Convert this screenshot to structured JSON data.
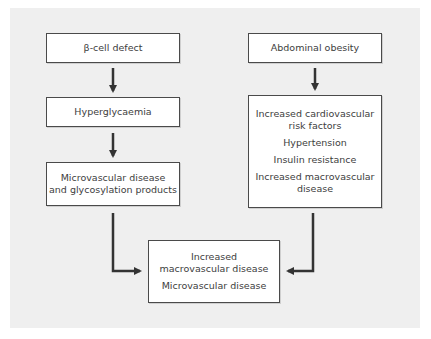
{
  "diagram": {
    "type": "flowchart",
    "colors": {
      "panel": "#efefef",
      "box_fill": "#ffffff",
      "box_border": "#4a4a4a",
      "arrow": "#333333",
      "text": "#3d3d3d"
    },
    "nodes": {
      "beta_cell": {
        "lines": [
          "β-cell defect"
        ]
      },
      "hyperglycaemia": {
        "lines": [
          "Hyperglycaemia"
        ]
      },
      "microvascular": {
        "lines": [
          "Microvascular disease",
          "and glycosylation products"
        ]
      },
      "abdominal_obesity": {
        "lines": [
          "Abdominal obesity"
        ]
      },
      "cardio_risk": {
        "items": [
          {
            "lines": [
              "Increased cardiovascular",
              "risk factors"
            ]
          },
          {
            "lines": [
              "Hypertension"
            ]
          },
          {
            "lines": [
              "Insulin resistance"
            ]
          },
          {
            "lines": [
              "Increased macrovascular",
              "disease"
            ]
          }
        ]
      },
      "outcome": {
        "items": [
          {
            "lines": [
              "Increased",
              "macrovascular disease"
            ]
          },
          {
            "lines": [
              "Microvascular disease"
            ]
          }
        ]
      }
    },
    "edges": [
      {
        "from": "beta_cell",
        "to": "hyperglycaemia"
      },
      {
        "from": "hyperglycaemia",
        "to": "microvascular"
      },
      {
        "from": "abdominal_obesity",
        "to": "cardio_risk"
      },
      {
        "from": "microvascular",
        "to": "outcome"
      },
      {
        "from": "cardio_risk",
        "to": "outcome"
      }
    ]
  }
}
